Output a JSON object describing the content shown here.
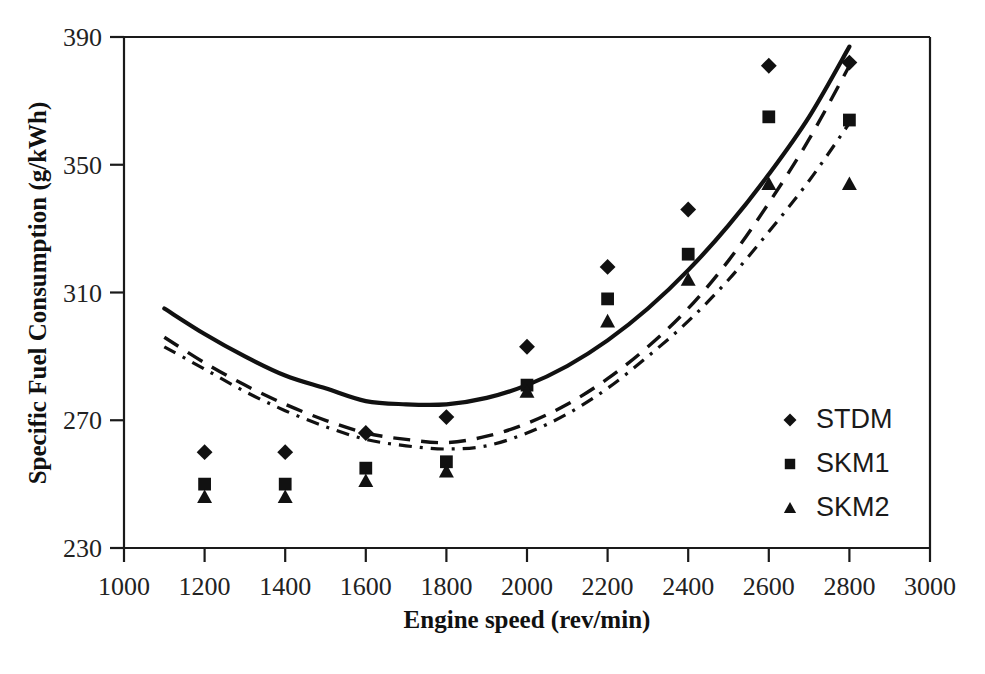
{
  "chart_data": {
    "type": "scatter",
    "title": "",
    "xlabel": "Engine speed (rev/min)",
    "ylabel": "Specific Fuel Consumption (g/kWh)",
    "xlim": [
      1000,
      3000
    ],
    "ylim": [
      230,
      390
    ],
    "xticks": [
      1000,
      1200,
      1400,
      1600,
      1800,
      2000,
      2200,
      2400,
      2600,
      2800,
      3000
    ],
    "yticks": [
      230,
      270,
      310,
      350,
      390
    ],
    "grid": false,
    "legend_position": "right-inside",
    "x": [
      1200,
      1400,
      1600,
      1800,
      2000,
      2200,
      2400,
      2600,
      2800
    ],
    "series": [
      {
        "name": "STDM",
        "marker": "diamond",
        "line_style": "solid",
        "values": [
          260,
          260,
          266,
          271,
          293,
          318,
          336,
          381,
          382
        ],
        "fit_curve": {
          "x": [
            1100,
            1200,
            1300,
            1400,
            1500,
            1600,
            1700,
            1800,
            1900,
            2000,
            2100,
            2200,
            2300,
            2400,
            2500,
            2600,
            2700,
            2800
          ],
          "y": [
            305,
            297,
            290,
            284,
            280,
            276,
            275,
            275,
            277,
            281,
            287,
            295,
            305,
            317,
            331,
            347,
            365,
            387
          ]
        }
      },
      {
        "name": "SKM1",
        "marker": "square",
        "line_style": "dashed",
        "values": [
          250,
          250,
          255,
          257,
          281,
          308,
          322,
          365,
          364
        ],
        "fit_curve": {
          "x": [
            1100,
            1200,
            1300,
            1400,
            1500,
            1600,
            1700,
            1800,
            1900,
            2000,
            2100,
            2200,
            2300,
            2400,
            2500,
            2600,
            2700,
            2800
          ],
          "y": [
            296,
            288,
            281,
            275,
            270,
            266,
            264,
            263,
            265,
            269,
            275,
            283,
            293,
            305,
            320,
            338,
            358,
            381
          ]
        }
      },
      {
        "name": "SKM2",
        "marker": "triangle",
        "line_style": "dash-dot",
        "values": [
          246,
          246,
          251,
          254,
          279,
          301,
          314,
          344,
          344
        ],
        "fit_curve": {
          "x": [
            1100,
            1200,
            1300,
            1400,
            1500,
            1600,
            1700,
            1800,
            1900,
            2000,
            2100,
            2200,
            2300,
            2400,
            2500,
            2600,
            2700,
            2800
          ],
          "y": [
            293,
            286,
            279,
            273,
            268,
            264,
            262,
            261,
            262,
            266,
            272,
            280,
            290,
            301,
            314,
            329,
            345,
            363
          ]
        }
      }
    ]
  },
  "legend": {
    "items": [
      {
        "label": "STDM",
        "marker": "diamond"
      },
      {
        "label": "SKM1",
        "marker": "square"
      },
      {
        "label": "SKM2",
        "marker": "triangle"
      }
    ]
  },
  "caption": {
    "text": ""
  }
}
